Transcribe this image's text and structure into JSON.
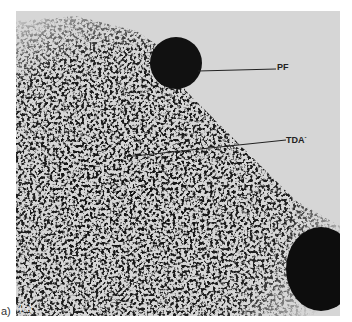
{
  "figure": {
    "panel_letter": "a)",
    "inset_letter": "(a)",
    "labels": [
      {
        "text": "PF",
        "x": 277,
        "y": 66
      },
      {
        "text": "TDA",
        "sup": "-",
        "x": 286,
        "y": 137
      }
    ],
    "colors": {
      "background": "#d6d6d6",
      "stain": "#1a1a1a"
    }
  }
}
